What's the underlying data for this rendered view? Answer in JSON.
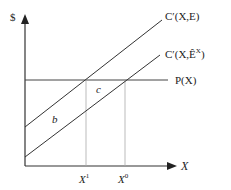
{
  "diagram": {
    "y_axis_label": "$",
    "x_axis_label": "X",
    "curves": [
      {
        "name": "upper-mc",
        "label_main": "C′(X,E)",
        "x1": 25,
        "y1": 127,
        "x2": 162,
        "y2": 20
      },
      {
        "name": "lower-mc",
        "label_main": "C′(X,",
        "label_e": "Ê",
        "label_sup": "X",
        "label_close": ")",
        "x1": 25,
        "y1": 157,
        "x2": 160,
        "y2": 55
      }
    ],
    "price_line": {
      "label": "P(X)",
      "y": 80
    },
    "regions": {
      "b": "b",
      "c": "c"
    },
    "ticks": {
      "x1_base": "X",
      "x1_sup": "1",
      "x0_base": "X",
      "x0_sup": "0"
    }
  }
}
